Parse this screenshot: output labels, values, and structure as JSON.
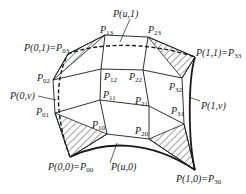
{
  "diagram": {
    "type": "bicubic-bezier-surface-patch",
    "control_points": {
      "P00": {
        "x": 70,
        "y": 157
      },
      "P10": {
        "x": 107,
        "y": 134
      },
      "P20": {
        "x": 149,
        "y": 139
      },
      "P30": {
        "x": 195,
        "y": 170
      },
      "P01": {
        "x": 55,
        "y": 113
      },
      "P11": {
        "x": 100,
        "y": 100
      },
      "P21": {
        "x": 149,
        "y": 106
      },
      "P31": {
        "x": 184,
        "y": 124
      },
      "P02": {
        "x": 53,
        "y": 80
      },
      "P12": {
        "x": 101,
        "y": 69
      },
      "P22": {
        "x": 143,
        "y": 70
      },
      "P32": {
        "x": 182,
        "y": 78
      },
      "P03": {
        "x": 68,
        "y": 54
      },
      "P13": {
        "x": 105,
        "y": 35
      },
      "P23": {
        "x": 148,
        "y": 37
      },
      "P33": {
        "x": 195,
        "y": 57
      }
    },
    "labels": {
      "u1": {
        "main": "P(u,1)"
      },
      "p13": {
        "main": "P",
        "sub": "13"
      },
      "p23": {
        "main": "P",
        "sub": "23"
      },
      "p01_corner": {
        "main": "P(0,1)=P",
        "sub": "03"
      },
      "p11_corner": {
        "main": "P(1,1)=P",
        "sub": "33"
      },
      "p02": {
        "main": "P",
        "sub": "02"
      },
      "p12": {
        "main": "P",
        "sub": "12"
      },
      "p22": {
        "main": "P",
        "sub": "22"
      },
      "p32": {
        "main": "P",
        "sub": "32"
      },
      "p0v": {
        "main": "P(0,v)"
      },
      "p11": {
        "main": "P",
        "sub": "11"
      },
      "p21": {
        "main": "P",
        "sub": "21"
      },
      "p1v": {
        "main": "P(1,v)"
      },
      "p31": {
        "main": "P",
        "sub": "31"
      },
      "p01": {
        "main": "P",
        "sub": "01"
      },
      "p10": {
        "main": "P",
        "sub": "10"
      },
      "p20": {
        "main": "P",
        "sub": "20"
      },
      "p00_corner": {
        "main": "P(0,0)=P",
        "sub": "00"
      },
      "u0": {
        "main": "P(u,0)"
      },
      "p10_corner": {
        "main": "P(1,0)=P",
        "sub": "30"
      }
    },
    "colors": {
      "line": "#1a1a1a",
      "background": "#ffffff"
    }
  }
}
